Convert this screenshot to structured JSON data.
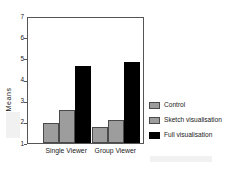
{
  "chart_data": {
    "type": "bar",
    "title": "",
    "xlabel": "",
    "ylabel": "Means",
    "categories": [
      "Single Viewer",
      "Group Viewer"
    ],
    "series": [
      {
        "name": "Control",
        "color": "#9d9d9d",
        "values": [
          1.95,
          1.78
        ]
      },
      {
        "name": "Sketch visualisation",
        "color": "#9d9d9d",
        "values": [
          2.55,
          2.1
        ]
      },
      {
        "name": "Full visualisation",
        "color": "#000000",
        "values": [
          4.62,
          4.82
        ]
      }
    ],
    "ylim": [
      1,
      7
    ],
    "yticks": [
      7,
      6,
      5,
      4,
      3,
      2,
      1
    ],
    "ytick_labels": [
      "7",
      "6",
      "5",
      "4",
      "3",
      "2",
      "1"
    ],
    "grid": false,
    "legend_position": "right"
  },
  "axis": {
    "y_title": "Means",
    "ticks": [
      {
        "label": "7",
        "value": 7
      },
      {
        "label": "6",
        "value": 6
      },
      {
        "label": "5",
        "value": 5
      },
      {
        "label": "4",
        "value": 4
      },
      {
        "label": "3",
        "value": 3
      },
      {
        "label": "2",
        "value": 2
      },
      {
        "label": "1",
        "value": 1
      }
    ]
  },
  "x_categories": [
    {
      "label": "Single Viewer"
    },
    {
      "label": "Group Viewer"
    }
  ],
  "legend": {
    "items": [
      {
        "label": "Control",
        "swatch": "gray"
      },
      {
        "label": "Sketch visualisation",
        "swatch": "gray"
      },
      {
        "label": "Full visualisation",
        "swatch": "black"
      }
    ]
  }
}
